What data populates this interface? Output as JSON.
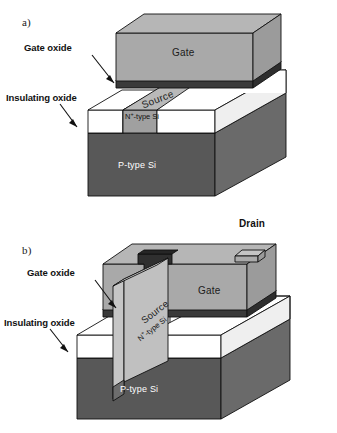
{
  "figure": {
    "background": "#ffffff",
    "panels": [
      {
        "id": "a",
        "letter": "a)",
        "type": "planar-mosfet",
        "callouts": [
          {
            "name": "gate-oxide",
            "text": "Gate oxide"
          },
          {
            "name": "insulating-oxide",
            "text": "Insulating oxide"
          }
        ],
        "parts": [
          {
            "name": "gate",
            "text": "Gate"
          },
          {
            "name": "source",
            "text": "Source"
          },
          {
            "name": "n-type-si",
            "text": "N",
            "sup": "+",
            "text_tail": "-type Si"
          },
          {
            "name": "p-type-si",
            "text": "P-type Si"
          }
        ]
      },
      {
        "id": "b",
        "letter": "b)",
        "type": "finfet",
        "callouts": [
          {
            "name": "gate-oxide",
            "text": "Gate oxide"
          },
          {
            "name": "insulating-oxide",
            "text": "Insulating oxide"
          }
        ],
        "parts": [
          {
            "name": "drain",
            "text": "Drain"
          },
          {
            "name": "gate",
            "text": "Gate"
          },
          {
            "name": "source",
            "text": "Source"
          },
          {
            "name": "n-type-si",
            "text": "N",
            "sup": "+",
            "text_tail": "-type Si"
          },
          {
            "name": "p-type-si",
            "text": "P-type Si"
          }
        ]
      }
    ]
  },
  "colors": {
    "gate_front": "#a9a9a9",
    "gate_top": "#b4b4b4",
    "gate_side": "#9a9a9a",
    "gate_oxide": "#3a3a3a",
    "insulating_oxide": "#ffffff",
    "insulating_oxide_side": "#f2f2f2",
    "substrate_front": "#585858",
    "substrate_side": "#6a6a6a",
    "source_top": "#b9b9b9",
    "source_front": "#a0a0a0",
    "fin_light": "#c8c8c8",
    "fin_mid": "#b0b0b0",
    "outline": "#111111",
    "label_dark": "#111111",
    "label_light": "#ffffff"
  }
}
